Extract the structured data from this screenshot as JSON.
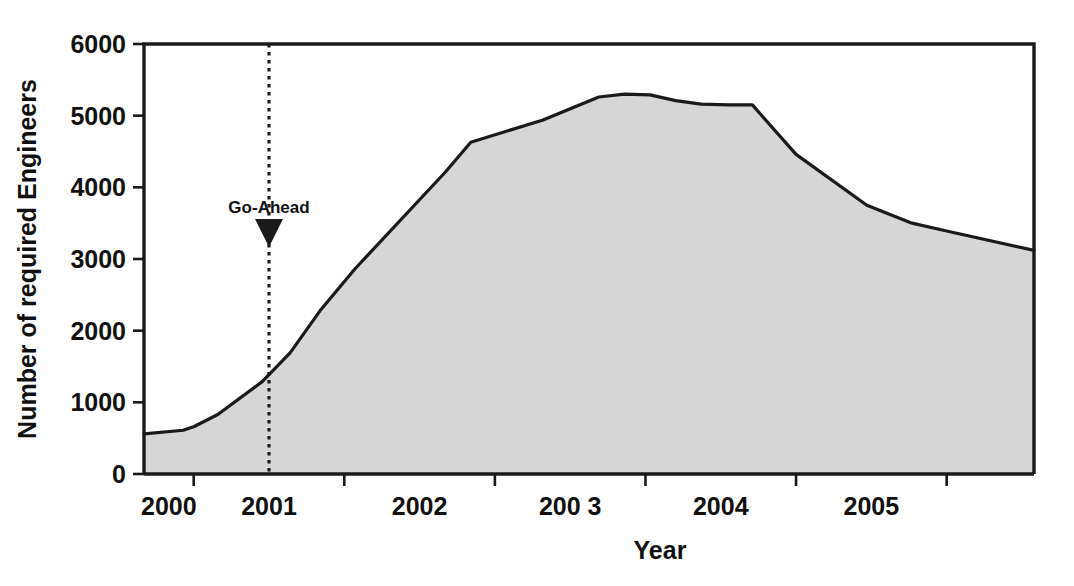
{
  "chart_data": {
    "type": "area",
    "title": "",
    "xlabel": "Year",
    "ylabel": "Number of required Engineers",
    "xlim": [
      1999.67,
      2005.58
    ],
    "ylim": [
      0,
      6000
    ],
    "grid": false,
    "legend": "none",
    "y_ticks": [
      0,
      1000,
      2000,
      3000,
      4000,
      5000,
      6000
    ],
    "y_tick_labels": [
      "0",
      "1000",
      "2000",
      "3000",
      "4000",
      "5000",
      "6000"
    ],
    "x_ticks": [
      2000.0,
      2001.0,
      2002.0,
      2003.0,
      2004.0,
      2005.0
    ],
    "x_tick_labels": [
      "2000",
      "2001",
      "2002",
      "200 3",
      "2004",
      "2005"
    ],
    "x_tick_label_positions": [
      1999.835,
      2000.5,
      2001.5,
      2002.5,
      2003.5,
      2004.5
    ],
    "series_name": "Required Engineers",
    "fill_color": "#d6d6d6",
    "line_color": "#1a1a1a",
    "x": [
      1999.67,
      1999.93,
      2000.0,
      2000.16,
      2000.45,
      2000.64,
      2000.84,
      2001.07,
      2001.67,
      2001.84,
      2002.32,
      2002.69,
      2002.86,
      2003.03,
      2003.2,
      2003.37,
      2003.55,
      2003.71,
      2004.0,
      2004.47,
      2004.77,
      2005.0,
      2005.58
    ],
    "y": [
      560,
      610,
      660,
      830,
      1280,
      1690,
      2280,
      2860,
      4210,
      4630,
      4940,
      5260,
      5300,
      5290,
      5210,
      5160,
      5150,
      5150,
      4460,
      3750,
      3500,
      3390,
      3120
    ],
    "annotations": [
      {
        "label": "Go-Ahead",
        "x": 2000.5,
        "marker": "down-triangle",
        "line_style": "dotted",
        "line_from_y": 6000,
        "line_to_y": 0
      }
    ]
  },
  "axes": {
    "y_title": "Number of required Engineers",
    "x_title": "Year"
  },
  "colors": {
    "frame": "#1a1a1a",
    "area_fill": "#d6d6d6",
    "line": "#1a1a1a",
    "text": "#111111",
    "background": "#ffffff"
  }
}
